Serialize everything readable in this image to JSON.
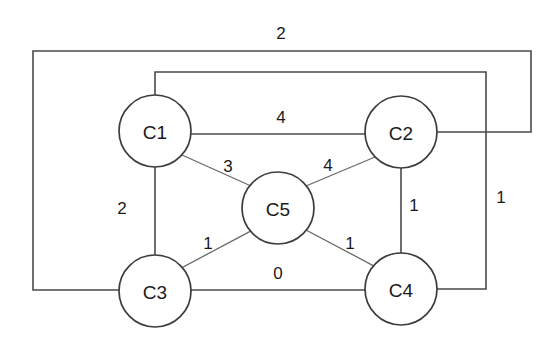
{
  "diagram": {
    "type": "weighted-undirected-graph",
    "title": "",
    "background_color": "#ffffff",
    "line_color": "#4a4a4a",
    "node_fill": "#ffffff",
    "node_stroke": "#3c3c3c",
    "text_color": "#1a1a1a",
    "nodes": [
      {
        "id": "C1",
        "label": "C1",
        "cx": 155,
        "cy": 131,
        "r": 36
      },
      {
        "id": "C2",
        "label": "C2",
        "cx": 401,
        "cy": 132,
        "r": 36
      },
      {
        "id": "C3",
        "label": "C3",
        "cx": 155,
        "cy": 291,
        "r": 36
      },
      {
        "id": "C4",
        "label": "C4",
        "cx": 401,
        "cy": 289,
        "r": 36
      },
      {
        "id": "C5",
        "label": "C5",
        "cx": 278,
        "cy": 208,
        "r": 36
      }
    ],
    "edges": [
      {
        "id": "e-c1-c2",
        "from": "C1",
        "to": "C2",
        "weight": "4",
        "label_x": 281,
        "label_y": 117,
        "routing": "straight"
      },
      {
        "id": "e-c1-c5",
        "from": "C1",
        "to": "C5",
        "weight": "3",
        "label_x": 228,
        "label_y": 166,
        "routing": "straight"
      },
      {
        "id": "e-c5-c2",
        "from": "C5",
        "to": "C2",
        "weight": "4",
        "label_x": 328,
        "label_y": 165,
        "routing": "straight"
      },
      {
        "id": "e-c1-c3",
        "from": "C1",
        "to": "C3",
        "weight": "2",
        "label_x": 122,
        "label_y": 208,
        "routing": "straight"
      },
      {
        "id": "e-c2-c4",
        "from": "C2",
        "to": "C4",
        "weight": "1",
        "label_x": 414,
        "label_y": 205,
        "routing": "straight"
      },
      {
        "id": "e-c3-c5",
        "from": "C3",
        "to": "C5",
        "weight": "1",
        "label_x": 208,
        "label_y": 243,
        "routing": "straight"
      },
      {
        "id": "e-c5-c4",
        "from": "C5",
        "to": "C4",
        "weight": "1",
        "label_x": 350,
        "label_y": 243,
        "routing": "straight"
      },
      {
        "id": "e-c3-c4",
        "from": "C3",
        "to": "C4",
        "weight": "0",
        "label_x": 278,
        "label_y": 273,
        "routing": "straight"
      },
      {
        "id": "e-c3-c2-outer",
        "from": "C3",
        "to": "C2",
        "weight": "2",
        "label_x": 281,
        "label_y": 33,
        "routing": "outer-rectangle"
      },
      {
        "id": "e-c1-c4-inner",
        "from": "C1",
        "to": "C4",
        "weight": "1",
        "label_x": 501,
        "label_y": 197,
        "routing": "inner-rectangle"
      }
    ],
    "adjacency_summary": [
      {
        "pair": "C1-C2",
        "weight": "4"
      },
      {
        "pair": "C1-C3",
        "weight": "2"
      },
      {
        "pair": "C1-C5",
        "weight": "3"
      },
      {
        "pair": "C1-C4",
        "weight": "1"
      },
      {
        "pair": "C2-C4",
        "weight": "1"
      },
      {
        "pair": "C2-C5",
        "weight": "4"
      },
      {
        "pair": "C2-C3",
        "weight": "2"
      },
      {
        "pair": "C3-C4",
        "weight": "0"
      },
      {
        "pair": "C3-C5",
        "weight": "1"
      },
      {
        "pair": "C4-C5",
        "weight": "1"
      }
    ]
  }
}
